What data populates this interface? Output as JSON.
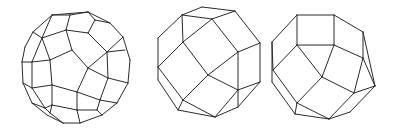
{
  "figures": [
    {
      "name": "polyhedron-1",
      "description": "Truncated-icosahedral-like polyhedron wireframe (pentagons and hexagons)",
      "stroke": "#2a2a2a",
      "edges": [
        [
          [
            52,
            15
          ],
          [
            88,
            12
          ]
        ],
        [
          [
            88,
            12
          ],
          [
            110,
            23
          ]
        ],
        [
          [
            110,
            23
          ],
          [
            123,
            37
          ]
        ],
        [
          [
            123,
            37
          ],
          [
            130,
            60
          ]
        ],
        [
          [
            130,
            60
          ],
          [
            128,
            83
          ]
        ],
        [
          [
            128,
            83
          ],
          [
            117,
            103
          ]
        ],
        [
          [
            117,
            103
          ],
          [
            102,
            115
          ]
        ],
        [
          [
            102,
            115
          ],
          [
            80,
            123
          ]
        ],
        [
          [
            80,
            123
          ],
          [
            63,
            123
          ]
        ],
        [
          [
            63,
            123
          ],
          [
            47,
            115
          ]
        ],
        [
          [
            47,
            115
          ],
          [
            32,
            103
          ]
        ],
        [
          [
            32,
            103
          ],
          [
            23,
            83
          ]
        ],
        [
          [
            23,
            83
          ],
          [
            22,
            62
          ]
        ],
        [
          [
            22,
            62
          ],
          [
            25,
            47
          ]
        ],
        [
          [
            25,
            47
          ],
          [
            33,
            32
          ]
        ],
        [
          [
            33,
            32
          ],
          [
            52,
            15
          ]
        ],
        [
          [
            52,
            15
          ],
          [
            70,
            15
          ]
        ],
        [
          [
            70,
            15
          ],
          [
            88,
            12
          ]
        ],
        [
          [
            88,
            12
          ],
          [
            95,
            20
          ]
        ],
        [
          [
            95,
            20
          ],
          [
            110,
            23
          ]
        ],
        [
          [
            33,
            32
          ],
          [
            42,
            38
          ]
        ],
        [
          [
            42,
            38
          ],
          [
            52,
            15
          ]
        ],
        [
          [
            70,
            15
          ],
          [
            66,
            30
          ]
        ],
        [
          [
            66,
            30
          ],
          [
            88,
            33
          ]
        ],
        [
          [
            88,
            33
          ],
          [
            95,
            20
          ]
        ],
        [
          [
            42,
            38
          ],
          [
            66,
            30
          ]
        ],
        [
          [
            42,
            38
          ],
          [
            32,
            62
          ]
        ],
        [
          [
            32,
            62
          ],
          [
            22,
            62
          ]
        ],
        [
          [
            32,
            62
          ],
          [
            50,
            60
          ]
        ],
        [
          [
            50,
            60
          ],
          [
            42,
            38
          ]
        ],
        [
          [
            66,
            30
          ],
          [
            72,
            50
          ]
        ],
        [
          [
            72,
            50
          ],
          [
            50,
            60
          ]
        ],
        [
          [
            72,
            50
          ],
          [
            88,
            68
          ]
        ],
        [
          [
            88,
            68
          ],
          [
            77,
            92
          ]
        ],
        [
          [
            77,
            92
          ],
          [
            52,
            85
          ]
        ],
        [
          [
            52,
            85
          ],
          [
            50,
            60
          ]
        ],
        [
          [
            88,
            33
          ],
          [
            107,
            52
          ]
        ],
        [
          [
            107,
            52
          ],
          [
            123,
            37
          ]
        ],
        [
          [
            107,
            52
          ],
          [
            88,
            68
          ]
        ],
        [
          [
            107,
            52
          ],
          [
            125,
            50
          ]
        ],
        [
          [
            88,
            68
          ],
          [
            108,
            78
          ]
        ],
        [
          [
            108,
            78
          ],
          [
            128,
            83
          ]
        ],
        [
          [
            108,
            78
          ],
          [
            107,
            52
          ]
        ],
        [
          [
            52,
            85
          ],
          [
            32,
            88
          ]
        ],
        [
          [
            32,
            88
          ],
          [
            32,
            62
          ]
        ],
        [
          [
            32,
            88
          ],
          [
            23,
            83
          ]
        ],
        [
          [
            32,
            88
          ],
          [
            45,
            108
          ]
        ],
        [
          [
            45,
            108
          ],
          [
            32,
            103
          ]
        ],
        [
          [
            52,
            85
          ],
          [
            52,
            105
          ]
        ],
        [
          [
            52,
            105
          ],
          [
            45,
            108
          ]
        ],
        [
          [
            77,
            92
          ],
          [
            77,
            110
          ]
        ],
        [
          [
            77,
            92
          ],
          [
            100,
            100
          ]
        ],
        [
          [
            100,
            100
          ],
          [
            108,
            78
          ]
        ],
        [
          [
            100,
            100
          ],
          [
            117,
            103
          ]
        ],
        [
          [
            52,
            105
          ],
          [
            77,
            110
          ]
        ],
        [
          [
            77,
            110
          ],
          [
            80,
            123
          ]
        ],
        [
          [
            77,
            110
          ],
          [
            97,
            110
          ]
        ],
        [
          [
            97,
            110
          ],
          [
            100,
            100
          ]
        ],
        [
          [
            97,
            110
          ],
          [
            102,
            115
          ]
        ],
        [
          [
            45,
            108
          ],
          [
            50,
            113
          ]
        ],
        [
          [
            50,
            113
          ],
          [
            63,
            123
          ]
        ],
        [
          [
            50,
            113
          ],
          [
            52,
            105
          ]
        ]
      ]
    },
    {
      "name": "polyhedron-2",
      "description": "Rhombicuboctahedron-like polyhedron wireframe",
      "stroke": "#2a2a2a",
      "edges": [
        [
          [
            182,
            15
          ],
          [
            202,
            7
          ]
        ],
        [
          [
            202,
            7
          ],
          [
            235,
            11
          ]
        ],
        [
          [
            235,
            11
          ],
          [
            212,
            19
          ]
        ],
        [
          [
            212,
            19
          ],
          [
            182,
            15
          ]
        ],
        [
          [
            182,
            15
          ],
          [
            158,
            38
          ]
        ],
        [
          [
            158,
            38
          ],
          [
            158,
            67
          ]
        ],
        [
          [
            158,
            67
          ],
          [
            158,
            80
          ]
        ],
        [
          [
            158,
            80
          ],
          [
            178,
            110
          ]
        ],
        [
          [
            178,
            110
          ],
          [
            215,
            117
          ]
        ],
        [
          [
            215,
            117
          ],
          [
            238,
            107
          ]
        ],
        [
          [
            238,
            107
          ],
          [
            260,
            82
          ]
        ],
        [
          [
            260,
            82
          ],
          [
            260,
            43
          ]
        ],
        [
          [
            260,
            43
          ],
          [
            235,
            11
          ]
        ],
        [
          [
            182,
            15
          ],
          [
            183,
            42
          ]
        ],
        [
          [
            183,
            42
          ],
          [
            212,
            19
          ]
        ],
        [
          [
            212,
            19
          ],
          [
            238,
            52
          ]
        ],
        [
          [
            238,
            52
          ],
          [
            260,
            43
          ]
        ],
        [
          [
            183,
            42
          ],
          [
            158,
            67
          ]
        ],
        [
          [
            183,
            42
          ],
          [
            208,
            75
          ]
        ],
        [
          [
            208,
            75
          ],
          [
            238,
            52
          ]
        ],
        [
          [
            238,
            52
          ],
          [
            238,
            90
          ]
        ],
        [
          [
            238,
            90
          ],
          [
            260,
            82
          ]
        ],
        [
          [
            208,
            75
          ],
          [
            238,
            90
          ]
        ],
        [
          [
            208,
            75
          ],
          [
            183,
            100
          ]
        ],
        [
          [
            183,
            100
          ],
          [
            158,
            67
          ]
        ],
        [
          [
            183,
            100
          ],
          [
            178,
            110
          ]
        ],
        [
          [
            183,
            100
          ],
          [
            215,
            117
          ]
        ],
        [
          [
            238,
            90
          ],
          [
            215,
            117
          ]
        ],
        [
          [
            238,
            90
          ],
          [
            238,
            107
          ]
        ]
      ]
    },
    {
      "name": "polyhedron-3",
      "description": "Elongated polyhedron wireframe with square top face",
      "stroke": "#2a2a2a",
      "edges": [
        [
          [
            297,
            15
          ],
          [
            334,
            15
          ]
        ],
        [
          [
            334,
            15
          ],
          [
            334,
            45
          ]
        ],
        [
          [
            334,
            45
          ],
          [
            297,
            45
          ]
        ],
        [
          [
            297,
            45
          ],
          [
            297,
            15
          ]
        ],
        [
          [
            297,
            15
          ],
          [
            272,
            42
          ]
        ],
        [
          [
            272,
            42
          ],
          [
            272,
            82
          ]
        ],
        [
          [
            272,
            82
          ],
          [
            295,
            114
          ]
        ],
        [
          [
            295,
            114
          ],
          [
            329,
            119
          ]
        ],
        [
          [
            329,
            119
          ],
          [
            350,
            112
          ]
        ],
        [
          [
            350,
            112
          ],
          [
            375,
            86
          ]
        ],
        [
          [
            375,
            86
          ],
          [
            363,
            32
          ]
        ],
        [
          [
            363,
            32
          ],
          [
            334,
            15
          ]
        ],
        [
          [
            297,
            45
          ],
          [
            273,
            70
          ]
        ],
        [
          [
            273,
            70
          ],
          [
            272,
            42
          ]
        ],
        [
          [
            273,
            70
          ],
          [
            297,
            103
          ]
        ],
        [
          [
            297,
            103
          ],
          [
            295,
            114
          ]
        ],
        [
          [
            297,
            45
          ],
          [
            322,
            77
          ]
        ],
        [
          [
            322,
            77
          ],
          [
            334,
            45
          ]
        ],
        [
          [
            334,
            45
          ],
          [
            363,
            58
          ]
        ],
        [
          [
            363,
            58
          ],
          [
            363,
            32
          ]
        ],
        [
          [
            363,
            58
          ],
          [
            375,
            86
          ]
        ],
        [
          [
            322,
            77
          ],
          [
            297,
            103
          ]
        ],
        [
          [
            322,
            77
          ],
          [
            354,
            93
          ]
        ],
        [
          [
            354,
            93
          ],
          [
            363,
            58
          ]
        ],
        [
          [
            354,
            93
          ],
          [
            375,
            86
          ]
        ],
        [
          [
            297,
            103
          ],
          [
            329,
            119
          ]
        ],
        [
          [
            354,
            93
          ],
          [
            329,
            119
          ]
        ]
      ]
    }
  ]
}
